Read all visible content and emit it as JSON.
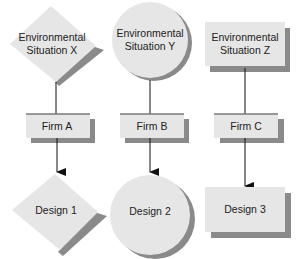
{
  "colors": {
    "fill": "#e6e6e6",
    "shadow": "#8a8a8a",
    "topline": "#7a7a7a",
    "arrow": "#111111",
    "text": "#222222"
  },
  "situations": [
    {
      "shape": "diamond",
      "line1": "Environmental",
      "line2": "Situation X"
    },
    {
      "shape": "circle",
      "line1": "Environmental",
      "line2": "Situation Y"
    },
    {
      "shape": "rectangle",
      "line1": "Environmental",
      "line2": "Situation Z"
    }
  ],
  "firms": [
    {
      "label": "Firm A"
    },
    {
      "label": "Firm B"
    },
    {
      "label": "Firm C"
    }
  ],
  "designs": [
    {
      "shape": "diamond",
      "label": "Design 1"
    },
    {
      "shape": "circle",
      "label": "Design 2"
    },
    {
      "shape": "rectangle",
      "label": "Design 3"
    }
  ]
}
